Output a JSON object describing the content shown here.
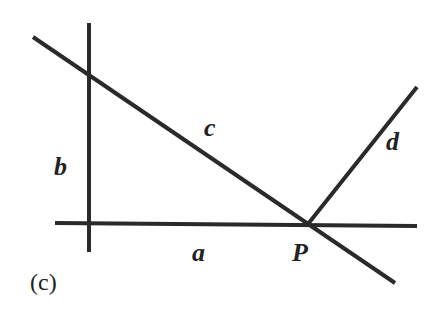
{
  "diagram": {
    "caption": "(c)",
    "stroke_color": "#2a2a2a",
    "background": "#ffffff",
    "lines": [
      {
        "name": "a",
        "from": [
          55,
          223
        ],
        "to": [
          417,
          226
        ]
      },
      {
        "name": "b",
        "from": [
          89,
          23
        ],
        "to": [
          89,
          252
        ]
      },
      {
        "name": "c",
        "from": [
          33,
          37
        ],
        "to": [
          395,
          283
        ]
      },
      {
        "name": "d",
        "from": [
          308,
          224
        ],
        "to": [
          417,
          87
        ]
      }
    ],
    "labels": {
      "a": "a",
      "b": "b",
      "c": "c",
      "d": "d",
      "P": "P"
    },
    "point": {
      "name": "P",
      "position": [
        308,
        224
      ]
    }
  }
}
